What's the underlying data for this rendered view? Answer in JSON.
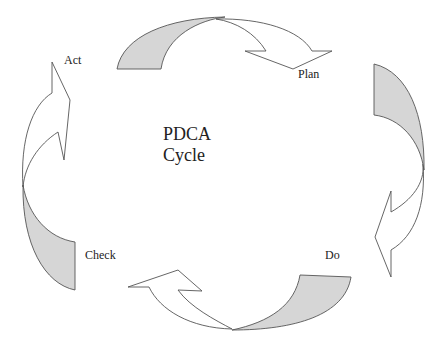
{
  "diagram": {
    "title_line1": "PDCA",
    "title_line2": "Cycle",
    "stages": [
      {
        "label": "Plan",
        "position": "top-right"
      },
      {
        "label": "Do",
        "position": "bottom-right"
      },
      {
        "label": "Check",
        "position": "bottom-left"
      },
      {
        "label": "Act",
        "position": "top-left"
      }
    ],
    "arrows": [
      {
        "from": "Act",
        "to": "Plan",
        "direction": "clockwise"
      },
      {
        "from": "Plan",
        "to": "Do",
        "direction": "clockwise"
      },
      {
        "from": "Do",
        "to": "Check",
        "direction": "clockwise"
      },
      {
        "from": "Check",
        "to": "Act",
        "direction": "clockwise"
      }
    ],
    "colors": {
      "arrow_tail_fill": "#d6d6d6",
      "arrow_head_fill": "#ffffff",
      "outline": "#555555",
      "text": "#222222",
      "background": "#ffffff"
    }
  }
}
